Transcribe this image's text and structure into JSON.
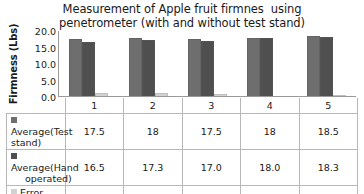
{
  "chart_data": {
    "type": "bar",
    "title": "Measurement of Apple fruit firmnes  using\npenetrometer (with and without test stand)",
    "xlabel": "",
    "ylabel": "Firmness (Lbs)",
    "categories": [
      "1",
      "2",
      "3",
      "4",
      "5"
    ],
    "ylim": [
      0,
      20
    ],
    "yticks": [
      "0.0",
      "5.0",
      "10.0",
      "15.0",
      "20.0"
    ],
    "ytick_values": [
      0,
      5,
      10,
      15,
      20
    ],
    "grid": false,
    "legend_position": "table-below",
    "series": [
      {
        "name": "Average(Test stand)",
        "label_lines": "Average(Test stand)",
        "color": "#6e6e6e",
        "values": [
          17.5,
          18,
          17.5,
          18,
          18.5
        ],
        "display_values": [
          "17.5",
          "18",
          "17.5",
          "18",
          "18.5"
        ]
      },
      {
        "name": "Average(Hand operated)",
        "label_lines": "Average(Hand\noperated)",
        "color": "#4f4f4f",
        "values": [
          16.5,
          17.3,
          17.0,
          18.0,
          18.3
        ],
        "display_values": [
          "16.5",
          "17.3",
          "17.0",
          "18.0",
          "18.3"
        ]
      },
      {
        "name": "Error (Lbs)",
        "label_lines": "Error (Lbs)",
        "color": "#d2d2d2",
        "values": [
          1.0,
          0.8,
          0.5,
          0.0,
          0.3
        ],
        "display_values": [
          "1.0",
          "0.8",
          "0.5",
          "0.0",
          "0.3"
        ]
      }
    ]
  }
}
